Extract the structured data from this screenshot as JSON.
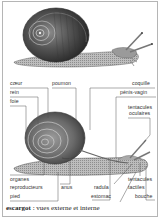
{
  "figure": {
    "title_word": "escargot",
    "title_rest": " : vues externe et interne",
    "views": [
      "externe",
      "interne"
    ]
  },
  "labels": {
    "coeur": "cœur",
    "rein": "rein",
    "foie": "foie",
    "poumon": "poumon",
    "coquille": "coquille",
    "penis_vagin": "pénis-vagin",
    "tentacules_oculaires_1": "tentacules",
    "tentacules_oculaires_2": "oculaires",
    "organes_reproducteurs_1": "organes",
    "organes_reproducteurs_2": "reproducteurs",
    "anus": "anus",
    "radula": "radula",
    "tentacules_tactiles_1": "tentacules",
    "tentacules_tactiles_2": "tactiles",
    "pied": "pied",
    "estomac": "estomac",
    "bouche": "bouche"
  },
  "colors": {
    "border": "#b5b5b5",
    "leader_lines": "#555555",
    "text": "#333333"
  }
}
